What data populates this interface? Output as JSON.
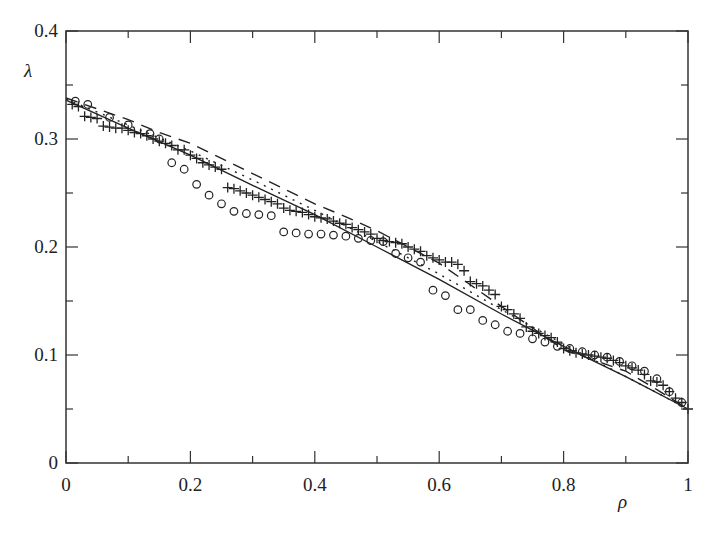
{
  "chart_data": {
    "type": "scatter",
    "title": "",
    "xlabel": "ρ",
    "ylabel": "λ",
    "xlim": [
      0,
      1
    ],
    "ylim": [
      0,
      0.4
    ],
    "grid": false,
    "legend": null,
    "x_ticks": [
      "0",
      "0.2",
      "0.4",
      "0.6",
      "0.8",
      "1"
    ],
    "y_ticks": [
      "0",
      "0.1",
      "0.2",
      "0.3",
      "0.4"
    ],
    "x_minor_ticks": [
      0.1,
      0.3,
      0.5,
      0.7,
      0.9
    ],
    "y_minor_ticks": [
      0.05,
      0.15,
      0.25,
      0.35
    ],
    "series": [
      {
        "name": "solid line",
        "style": "solid",
        "x": [
          0,
          0.1,
          0.2,
          0.3,
          0.4,
          0.5,
          0.6,
          0.7,
          0.8,
          0.9,
          1.0
        ],
        "y": [
          0.336,
          0.31,
          0.285,
          0.257,
          0.23,
          0.2,
          0.17,
          0.138,
          0.108,
          0.08,
          0.05
        ]
      },
      {
        "name": "dotted line",
        "style": "dotted",
        "x": [
          0,
          0.1,
          0.2,
          0.3,
          0.4,
          0.5,
          0.6,
          0.7,
          0.8,
          0.9,
          1.0
        ],
        "y": [
          0.337,
          0.313,
          0.289,
          0.262,
          0.234,
          0.205,
          0.175,
          0.142,
          0.11,
          0.08,
          0.05
        ]
      },
      {
        "name": "dashed line",
        "style": "dashed",
        "x": [
          0,
          0.05,
          0.1,
          0.15,
          0.2,
          0.25,
          0.3,
          0.35,
          0.4,
          0.45,
          0.5,
          0.55,
          0.6,
          0.65,
          0.7,
          0.75,
          0.8,
          0.85,
          0.9,
          0.95,
          1.0
        ],
        "y": [
          0.338,
          0.328,
          0.318,
          0.306,
          0.296,
          0.282,
          0.268,
          0.254,
          0.24,
          0.228,
          0.215,
          0.2,
          0.185,
          0.165,
          0.145,
          0.125,
          0.105,
          0.095,
          0.085,
          0.068,
          0.05
        ]
      },
      {
        "name": "plus markers",
        "marker": "+",
        "x": [
          0.01,
          0.02,
          0.03,
          0.04,
          0.05,
          0.06,
          0.07,
          0.08,
          0.09,
          0.1,
          0.11,
          0.12,
          0.13,
          0.14,
          0.15,
          0.16,
          0.17,
          0.18,
          0.19,
          0.2,
          0.21,
          0.22,
          0.23,
          0.24,
          0.25,
          0.26,
          0.27,
          0.28,
          0.29,
          0.3,
          0.31,
          0.32,
          0.33,
          0.34,
          0.35,
          0.36,
          0.37,
          0.38,
          0.39,
          0.4,
          0.41,
          0.42,
          0.43,
          0.44,
          0.45,
          0.46,
          0.47,
          0.48,
          0.49,
          0.5,
          0.51,
          0.52,
          0.53,
          0.54,
          0.55,
          0.56,
          0.57,
          0.58,
          0.59,
          0.6,
          0.61,
          0.62,
          0.63,
          0.64,
          0.65,
          0.66,
          0.67,
          0.68,
          0.69,
          0.7,
          0.71,
          0.72,
          0.73,
          0.74,
          0.75,
          0.76,
          0.77,
          0.78,
          0.79,
          0.8,
          0.81,
          0.82,
          0.83,
          0.84,
          0.85,
          0.86,
          0.87,
          0.88,
          0.89,
          0.9,
          0.91,
          0.92,
          0.93,
          0.94,
          0.95,
          0.96,
          0.97,
          0.98,
          0.99,
          1.0
        ],
        "y": [
          0.332,
          0.33,
          0.321,
          0.32,
          0.319,
          0.312,
          0.311,
          0.31,
          0.31,
          0.308,
          0.306,
          0.305,
          0.303,
          0.3,
          0.298,
          0.296,
          0.294,
          0.29,
          0.29,
          0.285,
          0.282,
          0.278,
          0.276,
          0.274,
          0.272,
          0.255,
          0.254,
          0.252,
          0.25,
          0.248,
          0.246,
          0.244,
          0.242,
          0.24,
          0.236,
          0.234,
          0.233,
          0.232,
          0.23,
          0.228,
          0.227,
          0.226,
          0.224,
          0.222,
          0.221,
          0.218,
          0.216,
          0.214,
          0.212,
          0.208,
          0.206,
          0.205,
          0.204,
          0.203,
          0.2,
          0.198,
          0.196,
          0.192,
          0.19,
          0.188,
          0.186,
          0.186,
          0.184,
          0.178,
          0.168,
          0.166,
          0.164,
          0.16,
          0.156,
          0.145,
          0.142,
          0.138,
          0.134,
          0.126,
          0.122,
          0.12,
          0.118,
          0.116,
          0.112,
          0.106,
          0.104,
          0.102,
          0.101,
          0.1,
          0.099,
          0.098,
          0.097,
          0.095,
          0.093,
          0.09,
          0.088,
          0.086,
          0.082,
          0.076,
          0.075,
          0.072,
          0.066,
          0.06,
          0.056,
          0.05
        ]
      },
      {
        "name": "circle markers",
        "marker": "o",
        "x": [
          0.015,
          0.035,
          0.07,
          0.1,
          0.135,
          0.15,
          0.17,
          0.19,
          0.21,
          0.23,
          0.25,
          0.27,
          0.29,
          0.31,
          0.33,
          0.35,
          0.37,
          0.39,
          0.41,
          0.43,
          0.45,
          0.47,
          0.49,
          0.51,
          0.53,
          0.55,
          0.57,
          0.59,
          0.61,
          0.63,
          0.65,
          0.67,
          0.69,
          0.71,
          0.73,
          0.75,
          0.77,
          0.79,
          0.81,
          0.83,
          0.85,
          0.87,
          0.89,
          0.91,
          0.93,
          0.95,
          0.97,
          0.99
        ],
        "y": [
          0.335,
          0.332,
          0.32,
          0.313,
          0.305,
          0.3,
          0.278,
          0.272,
          0.258,
          0.248,
          0.24,
          0.233,
          0.231,
          0.23,
          0.229,
          0.214,
          0.213,
          0.212,
          0.212,
          0.211,
          0.21,
          0.208,
          0.206,
          0.205,
          0.194,
          0.19,
          0.186,
          0.16,
          0.155,
          0.142,
          0.142,
          0.132,
          0.128,
          0.122,
          0.12,
          0.115,
          0.112,
          0.108,
          0.106,
          0.103,
          0.1,
          0.098,
          0.094,
          0.09,
          0.085,
          0.078,
          0.066,
          0.056
        ]
      }
    ]
  }
}
